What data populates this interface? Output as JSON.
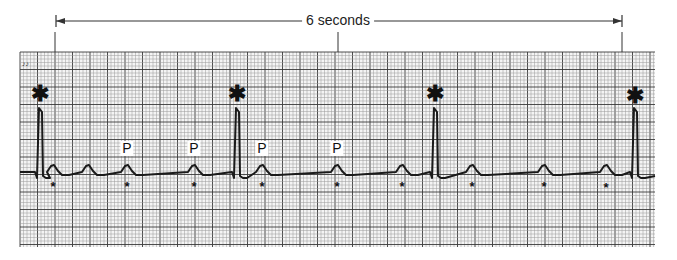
{
  "figure": {
    "duration_label": "6 seconds",
    "duration_span": {
      "x_start": 56,
      "x_end": 622,
      "y": 21,
      "center_tick_x": 338
    },
    "corner_mark": "♪♪",
    "grid": {
      "x": 20,
      "y": 52,
      "width": 635,
      "height": 195,
      "small": 3.5,
      "large": 17.5,
      "small_color": "#9a9a9a",
      "large_color": "#3a3a3a"
    },
    "trace": {
      "color": "#1a1a1a",
      "baseline_y": 172
    },
    "qrs_complexes": [
      {
        "x": 40,
        "peak_y": 108
      },
      {
        "x": 237,
        "peak_y": 108
      },
      {
        "x": 435,
        "peak_y": 108
      },
      {
        "x": 635,
        "peak_y": 108
      }
    ],
    "p_waves_x": [
      53,
      88,
      127,
      194,
      262,
      337,
      402,
      472,
      544,
      606
    ],
    "labels": {
      "qrs_markers": [
        {
          "x": 40,
          "y": 94,
          "text": "✱"
        },
        {
          "x": 237,
          "y": 94,
          "text": "✱"
        },
        {
          "x": 435,
          "y": 94,
          "text": "✱"
        },
        {
          "x": 635,
          "y": 96,
          "text": "✱"
        }
      ],
      "p_labels": [
        {
          "x": 127,
          "y": 141,
          "text": "P"
        },
        {
          "x": 194,
          "y": 141,
          "text": "P"
        },
        {
          "x": 262,
          "y": 141,
          "text": "P"
        },
        {
          "x": 337,
          "y": 141,
          "text": "P"
        }
      ],
      "p_markers": [
        {
          "x": 53,
          "y": 186,
          "text": "*"
        },
        {
          "x": 127,
          "y": 186,
          "text": "*"
        },
        {
          "x": 194,
          "y": 186,
          "text": "*"
        },
        {
          "x": 262,
          "y": 186,
          "text": "*"
        },
        {
          "x": 337,
          "y": 186,
          "text": "*"
        },
        {
          "x": 402,
          "y": 186,
          "text": "*"
        },
        {
          "x": 472,
          "y": 186,
          "text": "*"
        },
        {
          "x": 544,
          "y": 186,
          "text": "*"
        },
        {
          "x": 606,
          "y": 187,
          "text": "*"
        }
      ]
    }
  }
}
